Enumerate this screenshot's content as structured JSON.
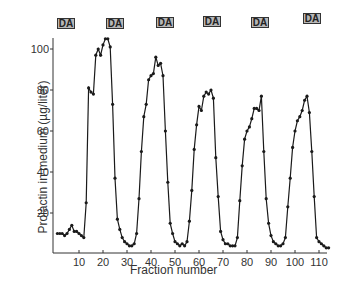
{
  "chart_data": {
    "type": "line",
    "title": "",
    "xlabel": "Fraction number",
    "ylabel": "Prolactin in medium (µg/liter)",
    "xlim": [
      0,
      115
    ],
    "ylim": [
      0,
      105
    ],
    "xticks": [
      10,
      20,
      30,
      40,
      50,
      60,
      70,
      80,
      90,
      100,
      110
    ],
    "yticks": [
      20,
      40,
      60,
      80,
      100
    ],
    "grid": false,
    "legend": null,
    "markers": "filled-circle",
    "annotations": [
      {
        "label": "DA",
        "x_fraction_center": 9
      },
      {
        "label": "DA",
        "x_fraction_center": 29
      },
      {
        "label": "DA",
        "x_fraction_center": 50
      },
      {
        "label": "DA",
        "x_fraction_center": 69
      },
      {
        "label": "DA",
        "x_fraction_center": 88
      },
      {
        "label": "DA",
        "x_fraction_center": 110
      }
    ],
    "series": [
      {
        "name": "Prolactin",
        "x": [
          1,
          2,
          3,
          4,
          5,
          6,
          7,
          8,
          9,
          10,
          11,
          12,
          13,
          14,
          15,
          16,
          17,
          18,
          19,
          20,
          21,
          22,
          23,
          24,
          25,
          26,
          27,
          28,
          29,
          30,
          31,
          32,
          33,
          34,
          35,
          36,
          37,
          38,
          39,
          40,
          41,
          42,
          43,
          44,
          45,
          46,
          47,
          48,
          49,
          50,
          51,
          52,
          53,
          54,
          55,
          56,
          57,
          58,
          59,
          60,
          61,
          62,
          63,
          64,
          65,
          66,
          67,
          68,
          69,
          70,
          71,
          72,
          73,
          74,
          75,
          76,
          77,
          78,
          79,
          80,
          81,
          82,
          83,
          84,
          85,
          86,
          87,
          88,
          89,
          90,
          91,
          92,
          93,
          94,
          95,
          96,
          97,
          98,
          99,
          100,
          101,
          102,
          103,
          104,
          105,
          106,
          107,
          108,
          109,
          110,
          111,
          112,
          113,
          114
        ],
        "values": [
          10,
          10,
          10,
          9,
          10,
          12,
          14,
          11,
          11,
          10,
          9,
          8,
          25,
          81,
          79,
          78,
          97,
          100,
          97,
          102,
          105,
          105,
          101,
          73,
          37,
          17,
          12,
          8,
          6,
          5,
          4,
          4,
          5,
          10,
          27,
          50,
          67,
          73,
          85,
          87,
          88,
          96,
          92,
          93,
          87,
          60,
          35,
          15,
          10,
          6,
          5,
          4,
          5,
          4,
          6,
          16,
          31,
          51,
          63,
          72,
          70,
          77,
          79,
          78,
          80,
          76,
          47,
          28,
          11,
          7,
          5,
          5,
          4,
          4,
          4,
          8,
          26,
          43,
          56,
          60,
          62,
          66,
          71,
          71,
          70,
          77,
          50,
          27,
          15,
          9,
          6,
          5,
          4,
          4,
          5,
          8,
          23,
          37,
          52,
          60,
          65,
          67,
          70,
          75,
          77,
          69,
          50,
          28,
          8,
          6,
          5,
          4,
          3,
          3
        ]
      }
    ]
  },
  "labels": {
    "xlabel": "Fraction number",
    "ylabel": "Prolactin in medium (µg/liter)",
    "badge": "DA"
  },
  "layout": {
    "x0_px": 55,
    "px_per_fraction": 2.4,
    "y0_px": 254,
    "px_per_unit": 2.05,
    "axis_left_px": 53,
    "axis_bottom_px": 253,
    "axis_right_px": 327,
    "axis_top_px": 38,
    "badge_left_px": [
      57,
      106,
      156,
      203,
      251,
      303
    ],
    "badge_top_px": [
      18,
      18,
      17,
      16,
      17,
      13
    ],
    "line_color": "#1a1a1a",
    "badge_fill": "#b8b8b8"
  }
}
